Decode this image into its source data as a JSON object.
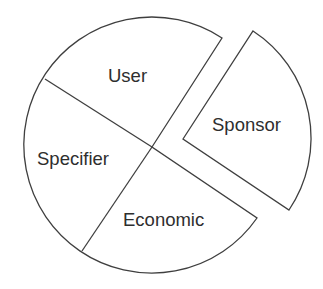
{
  "diagram": {
    "type": "pie-exploded",
    "segments": [
      {
        "key": "user",
        "label": "User"
      },
      {
        "key": "specifier",
        "label": "Specifier"
      },
      {
        "key": "economic",
        "label": "Economic"
      },
      {
        "key": "sponsor",
        "label": "Sponsor",
        "exploded": true
      }
    ],
    "colors": {
      "stroke": "#3f3f3f",
      "fill": "#ffffff",
      "text": "#2e2e2e"
    }
  }
}
